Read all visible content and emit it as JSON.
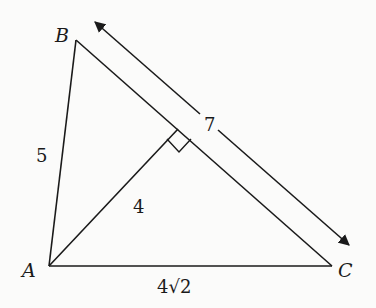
{
  "diagram": {
    "type": "triangle-with-altitude",
    "colors": {
      "stroke": "#1a1a1a",
      "background": "#fbfbfa"
    },
    "vertices": {
      "A": {
        "label": "A"
      },
      "B": {
        "label": "B"
      },
      "C": {
        "label": "C"
      }
    },
    "sides": {
      "AB": {
        "label": "5"
      },
      "AC": {
        "label": "4√2"
      },
      "BC": {
        "label": "7"
      }
    },
    "altitude": {
      "from": "A",
      "to": "BC",
      "label": "4",
      "right_angle_marker": true
    },
    "dimension_arrow": {
      "along": "BC",
      "label": "7",
      "double_headed": true
    }
  }
}
